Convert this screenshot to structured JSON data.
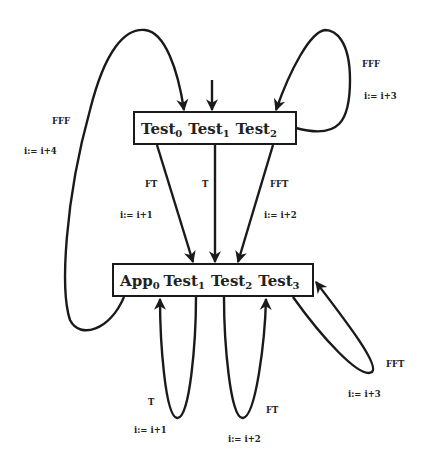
{
  "diagram": {
    "type": "state-transition",
    "nodes": [
      {
        "id": "top",
        "terms": [
          {
            "base": "Test",
            "sub": "0"
          },
          {
            "base": "Test",
            "sub": "1"
          },
          {
            "base": "Test",
            "sub": "2"
          }
        ]
      },
      {
        "id": "bottom",
        "terms": [
          {
            "base": "App",
            "sub": "0"
          },
          {
            "base": "Test",
            "sub": "1"
          },
          {
            "base": "Test",
            "sub": "2"
          },
          {
            "base": "Test",
            "sub": "3"
          }
        ]
      }
    ],
    "edges": [
      {
        "id": "top-self-left",
        "from": "bottom",
        "to": "top",
        "condition": "FFF",
        "action": "i := i+4"
      },
      {
        "id": "top-self-right",
        "from": "top",
        "to": "top",
        "condition": "FFF",
        "action": "i := i+3"
      },
      {
        "id": "top-to-bottom-left",
        "from": "top",
        "to": "bottom",
        "condition": "FT",
        "action": "i := i+1"
      },
      {
        "id": "top-to-bottom-mid",
        "from": "top",
        "to": "bottom",
        "condition": "T",
        "action": ""
      },
      {
        "id": "top-to-bottom-right",
        "from": "top",
        "to": "bottom",
        "condition": "FFT",
        "action": "i := i+2"
      },
      {
        "id": "bottom-self-1",
        "from": "bottom",
        "to": "bottom",
        "condition": "T",
        "action": "i := i+1"
      },
      {
        "id": "bottom-self-2",
        "from": "bottom",
        "to": "bottom",
        "condition": "FT",
        "action": "i := i+2"
      },
      {
        "id": "bottom-self-3",
        "from": "bottom",
        "to": "bottom",
        "condition": "FFT",
        "action": "i := i+3"
      }
    ]
  },
  "labels": {
    "fff_left": "FFF",
    "inc4": "i:= i+4",
    "fff_right": "FFF",
    "inc3_top": "i:= i+3",
    "ft_top": "FT",
    "inc1_top": "i:= i+1",
    "t_top": "T",
    "fft_top": "FFT",
    "inc2_top": "i:= i+2",
    "t_bot": "T",
    "inc1_bot": "i:= i+1",
    "ft_bot": "FT",
    "inc2_bot": "i:= i+2",
    "fft_bot": "FFT",
    "inc3_bot": "i:= i+3"
  },
  "top_box": {
    "t0": "Test",
    "s0": "0",
    "t1": "Test",
    "s1": "1",
    "t2": "Test",
    "s2": "2"
  },
  "bottom_box": {
    "t0": "App",
    "s0": "0",
    "t1": "Test",
    "s1": "1",
    "t2": "Test",
    "s2": "2",
    "t3": "Test",
    "s3": "3"
  }
}
